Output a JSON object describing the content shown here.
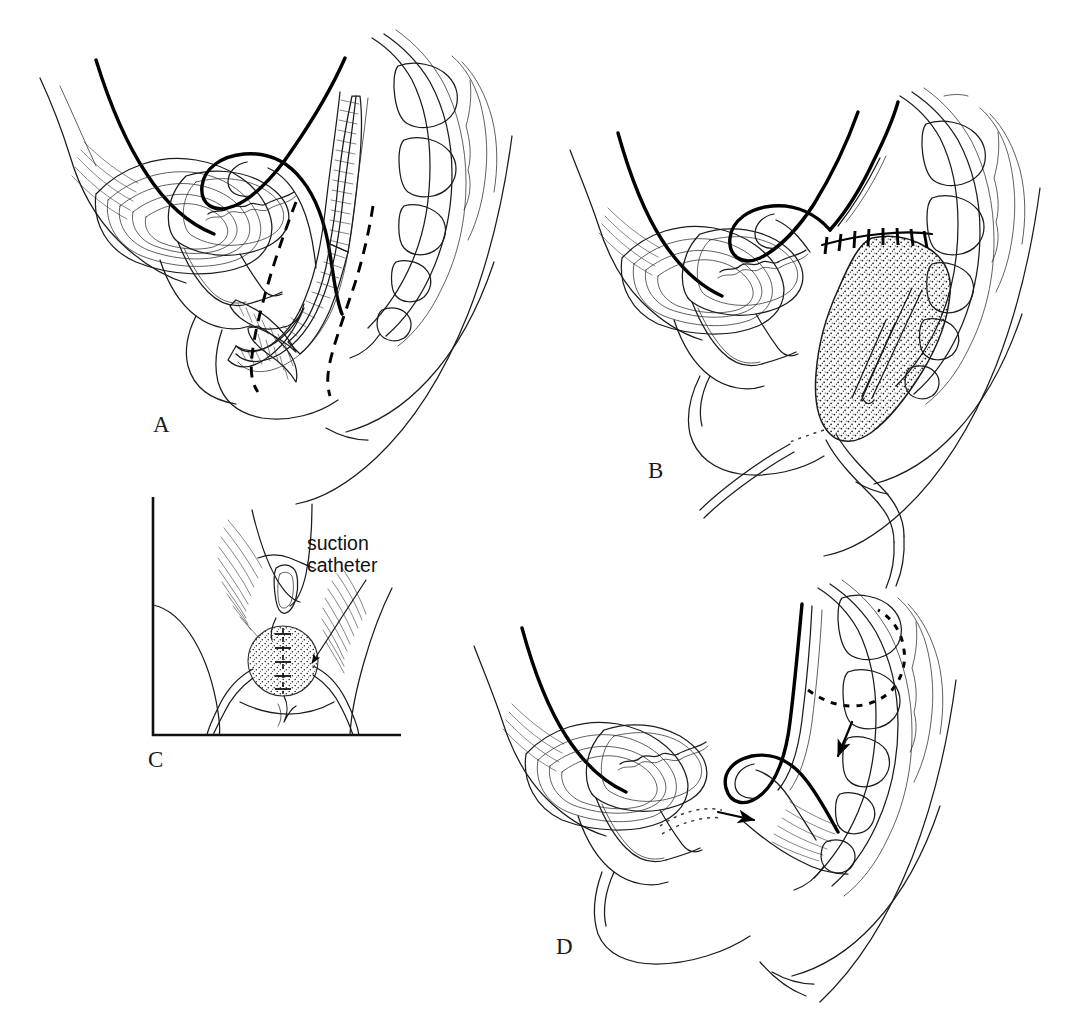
{
  "figure": {
    "kind": "medical-surgical-illustration",
    "background_color": "#ffffff",
    "ink_color": "#1b1b1b",
    "width": 1090,
    "height": 1019,
    "panel_labels": {
      "a": "A",
      "b": "B",
      "c": "C",
      "d": "D"
    },
    "callouts": [
      {
        "id": "suction-catheter",
        "line1": "suction",
        "line2": "catheter",
        "text": "suction catheter",
        "has_leader_arrow": true
      }
    ],
    "panels": [
      {
        "id": "a",
        "label": "A",
        "view": "midsagittal pelvis, patient facing left",
        "features": [
          "bladder",
          "uterus",
          "vagina with rugal folds",
          "rectum with hatched mucosal folds",
          "sacrum and coccyx with vertebral bodies",
          "bold dashed incision / resection lines around rectum",
          "symphysis pubis",
          "posterior thigh / buttock contour"
        ],
        "annotation_style": "bold dashed resection outline"
      },
      {
        "id": "b",
        "label": "B",
        "view": "midsagittal pelvis after resection",
        "features": [
          "stippled packed presacral cavity",
          "interrupted suture line across superior closure",
          "suction catheter within cavity",
          "catheter tubing exiting through perineum",
          "sacral vertebral bodies",
          "bladder, uterus and vagina unchanged"
        ],
        "annotation_style": "stipple fill with suture ticks"
      },
      {
        "id": "c",
        "label": "C",
        "view": "inset — perineal / lithotomy view",
        "features": [
          "L-shaped inset frame",
          "vulva and labia with shaded hatching",
          "stippled perineal wound with interrupted closure sutures",
          "two catheter limbs emerging and curving to the thighs",
          "leader arrow labelled suction catheter"
        ],
        "annotation_style": "inset frame with labelled leader arrow"
      },
      {
        "id": "d",
        "label": "D",
        "view": "midsagittal pelvis, healed result",
        "features": [
          "bladder",
          "uterus",
          "vagina",
          "reconstructed rectum drawn back against the sacrum",
          "dotted arc marking former lesion position",
          "solid arrow directed posteroinferiorly",
          "solid arrow directed anteriorly with dotted trajectory",
          "levator muscle striations",
          "sacral vertebral bodies"
        ],
        "annotation_style": "dotted former outline plus directional arrows"
      }
    ]
  }
}
